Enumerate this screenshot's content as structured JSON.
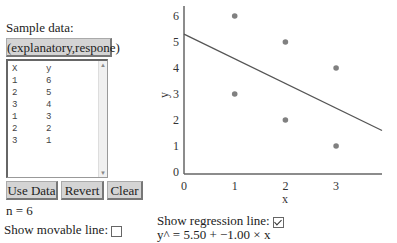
{
  "panel": {
    "sample_label": "Sample data:",
    "dataset_button": "(explanatory,respone)",
    "list": {
      "headers": [
        "X",
        "y"
      ],
      "rows": [
        [
          "1",
          "6"
        ],
        [
          "2",
          "5"
        ],
        [
          "3",
          "4"
        ],
        [
          "1",
          "3"
        ],
        [
          "2",
          "2"
        ],
        [
          "3",
          "1"
        ]
      ]
    },
    "buttons": {
      "use_data": "Use Data",
      "revert": "Revert",
      "clear": "Clear"
    },
    "n_label": "n = 6",
    "movable_line_label": "Show movable line:",
    "movable_line_checked": false
  },
  "regression": {
    "label": "Show regression line:",
    "checked": true,
    "equation": "y^ = 5.50 + −1.00 × x"
  },
  "chart_data": {
    "type": "scatter",
    "xlabel": "x",
    "ylabel": "y",
    "x_ticks": [
      "0",
      "1",
      "2",
      "3"
    ],
    "y_ticks": [
      "0",
      "1",
      "2",
      "3",
      "4",
      "5",
      "6"
    ],
    "xlim": [
      0,
      3.9
    ],
    "ylim": [
      0,
      6.5
    ],
    "points": [
      [
        1,
        6
      ],
      [
        2,
        5
      ],
      [
        3,
        4
      ],
      [
        1,
        3
      ],
      [
        2,
        2
      ],
      [
        3,
        1
      ]
    ],
    "regression_line": {
      "intercept": 5.5,
      "slope": -1.0
    },
    "point_color": "#808080",
    "line_color": "#555555"
  }
}
